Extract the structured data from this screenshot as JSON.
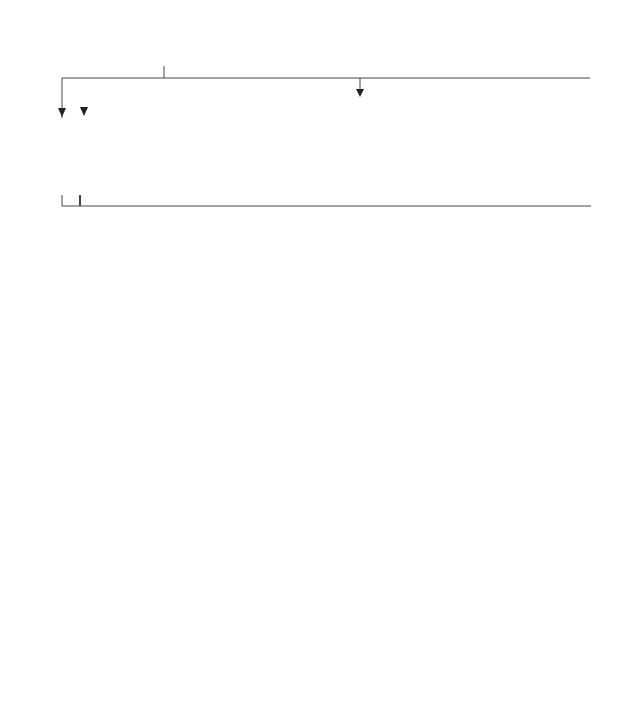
{
  "diagram": {
    "type": "flowchart",
    "boxes": {
      "plea_hearing": "At the plea and directions hearing or immediately before the trial, defence counsel informs the prosecution that he or she intends to object to the admission of the confession.",
      "judge_discretion": "At the trial the judge exercises his or her discretion to raise the issue of the admissibility of the confession.",
      "case_depends": "If the prosecution case depends wholly or largely on the confession and therefore they cannot sensibly open their case without referring to it, the issue is raised immediately after the jury is empanelled. N.B.: If subsequently the judge rules the confession inadmissible, the prosecution will often offer no evidence.",
      "case_not_depends": "If the prosecution case does not depend wholly or largely on the confession, counsel for the prosecution makes no reference to it in his or her opening speech and at that point in the trial when he or she would otherwise have adduced evidence of it, indicates to the judge that a point of law has arisen which does not concern the jury.",
      "jury_retire": {
        "before": "The judge requests the jury to retire to their room: see ",
        "case_name": "R v Davis",
        "after": " [1990] Crim LR 860 (CA)."
      },
      "defence_represents": "Defence counsel represents that, or the judge questions whether, the confession was or may have been obtained by oppression or in consequence of anything said or done likely to render unreliable any confession which might be made in consequence thereof: Police and Criminal Evidence Act 1984, s 76(2) and (3).",
      "prosecution_call": {
        "before": "The prosecution call the person(s) towhom the confession was made, typically an officer (and any other person who can give relevant evidence on the question of admissibility), to give evidence on a special form of oath known as a ",
        "term": "voir dire",
        "after": ". The officer will give evidence of the circumstances in which the confession was made. If there is a contemporaneous note of the interview (containing the confession) signed by the accused (or transcript of a tape recording of an interview), it will be produced before the judge. Defence counsel may cross-examine."
      },
      "accused_called": "The accused (and any other person who can give relevant evidence) may then be called and cross-examined. N.B.: The accused should not be asked if the confession was true: PACE 1984, s 76(2).",
      "submissions": "Submissions by counsel on the question of admissibility.",
      "judge_decision": "The judge gives his or her decision on the evidence heard and the question of admissibility (PACE 1984, ss 76 and 78) and recalls the jury.",
      "ruled_inadmissible": "Confession ruled inadmissible: the prosecution continue with their case, without referring to the confession, or offer no evidence — see above.",
      "ruled_admissible": "Confession ruled admissible: prosecution adduce evidence of the confession.",
      "cross_examine_witnesses": "Defence counsel may cross-examine the prosecution witness(es) to whom the confession was made and adduce evidence with a view to reducing the weight to be attached to the confession by the jury."
    },
    "edges": [
      [
        "plea_hearing",
        "case_depends"
      ],
      [
        "plea_hearing",
        "case_not_depends"
      ],
      [
        "case_depends",
        "jury_retire"
      ],
      [
        "case_not_depends",
        "jury_retire"
      ],
      [
        "judge_discretion",
        "jury_retire"
      ],
      [
        "jury_retire",
        "defence_represents"
      ],
      [
        "defence_represents",
        "prosecution_call"
      ],
      [
        "prosecution_call",
        "accused_called"
      ],
      [
        "accused_called",
        "submissions"
      ],
      [
        "submissions",
        "judge_decision"
      ],
      [
        "judge_decision",
        "ruled_inadmissible"
      ],
      [
        "judge_decision",
        "ruled_admissible"
      ],
      [
        "ruled_admissible",
        "cross_examine_witnesses"
      ]
    ],
    "colors": {
      "line": "#444444",
      "border": "#6e6e6e",
      "text": "#2a2a2a"
    }
  }
}
